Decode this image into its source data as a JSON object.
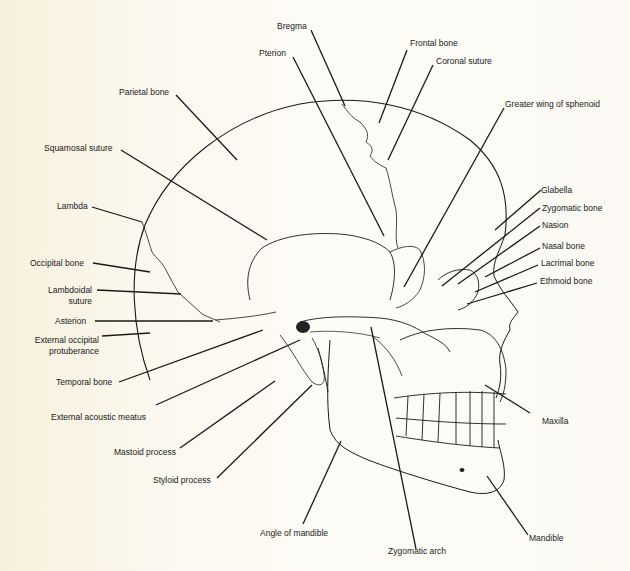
{
  "figure": {
    "background_color": "#fbf8ef",
    "line_color": "#1a1a1a"
  },
  "labels": {
    "bregma": "Bregma",
    "pterion": "Pterion",
    "frontal_bone": "Frontal bone",
    "coronal_suture": "Coronal suture",
    "parietal_bone": "Parietal bone",
    "greater_wing_sphenoid": "Greater wing of sphenoid",
    "squamosal_suture": "Squamosal suture",
    "glabella": "Glabella",
    "zygomatic_bone": "Zygomatic bone",
    "nasion": "Nasion",
    "lambda": "Lambda",
    "nasal_bone": "Nasal bone",
    "lacrimal_bone": "Lacrimal bone",
    "ethmoid_bone": "Ethmoid bone",
    "occipital_bone": "Occipital bone",
    "lambdoidal_suture_1": "Lambdoidal",
    "lambdoidal_suture_2": "suture",
    "asterion": "Asterion",
    "ext_occ_prot_1": "External occipital",
    "ext_occ_prot_2": "protuberance",
    "temporal_bone": "Temporal bone",
    "ext_acoustic_meatus": "External acoustic meatus",
    "maxilla": "Maxilla",
    "mastoid_process": "Mastoid process",
    "styloid_process": "Styloid process",
    "angle_of_mandible": "Angle of mandible",
    "mandible": "Mandible",
    "zygomatic_arch": "Zygomatic arch"
  }
}
